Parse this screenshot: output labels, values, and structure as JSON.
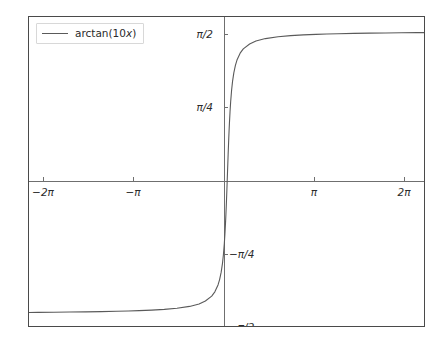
{
  "chart_data": {
    "type": "line",
    "title": "",
    "xlabel": "",
    "ylabel": "",
    "grid": false,
    "legend_position": "upper left",
    "xlim": [
      -6.283185307179586,
      6.283185307179586
    ],
    "ylim": [
      -1.7278759594743862,
      1.7278759594743862
    ],
    "xticks": [
      -6.283185307179586,
      -3.141592653589793,
      3.141592653589793,
      6.283185307179586
    ],
    "xticklabels": [
      "−2π",
      "−π",
      "π",
      "2π"
    ],
    "yticks": [
      -1.5707963267948966,
      -0.7853981633974483,
      0.7853981633974483,
      1.5707963267948966
    ],
    "yticklabels": [
      "−π/2",
      "−π/4",
      "π/4",
      "π/2"
    ],
    "spines": "centered-at-origin",
    "series": [
      {
        "name": "arctan(10x)",
        "legend_label_prefix": "arctan(10",
        "legend_label_variable": "x",
        "legend_label_suffix": ")",
        "color": "#5a5a5a",
        "linewidth": 1.1,
        "formula": "arctan(10*x)",
        "x": [
          -6.2832,
          -6.0,
          -5.5,
          -5.0,
          -4.5,
          -4.0,
          -3.5,
          -3.1416,
          -2.8,
          -2.4,
          -2.0,
          -1.6,
          -1.2,
          -0.9,
          -0.7,
          -0.5,
          -0.4,
          -0.3,
          -0.25,
          -0.2,
          -0.16,
          -0.13,
          -0.1,
          -0.08,
          -0.06,
          -0.05,
          -0.04,
          -0.03,
          -0.02,
          -0.01,
          0.0,
          0.01,
          0.02,
          0.03,
          0.04,
          0.05,
          0.06,
          0.08,
          0.1,
          0.13,
          0.16,
          0.2,
          0.25,
          0.3,
          0.4,
          0.5,
          0.7,
          0.9,
          1.2,
          1.6,
          2.0,
          2.4,
          2.8,
          3.1416,
          3.5,
          4.0,
          4.5,
          5.0,
          5.5,
          6.0,
          6.2832
        ],
        "y": [
          -1.5549,
          -1.5541,
          -1.5526,
          -1.5508,
          -1.5486,
          -1.5458,
          -1.5423,
          -1.539,
          -1.5351,
          -1.5292,
          -1.5208,
          -1.5083,
          -1.488,
          -1.4622,
          -1.4279,
          -1.3734,
          -1.3258,
          -1.249,
          -1.1903,
          -1.1071,
          -1.0122,
          -0.916,
          -0.7854,
          -0.6747,
          -0.5404,
          -0.4636,
          -0.3805,
          -0.2915,
          -0.1974,
          -0.0997,
          0.0,
          0.0997,
          0.1974,
          0.2915,
          0.3805,
          0.4636,
          0.5404,
          0.6747,
          0.7854,
          0.916,
          1.0122,
          1.1071,
          1.1903,
          1.249,
          1.3258,
          1.3734,
          1.4279,
          1.4622,
          1.488,
          1.5083,
          1.5208,
          1.5292,
          1.5351,
          1.539,
          1.5423,
          1.5458,
          1.5486,
          1.5508,
          1.5526,
          1.5541,
          1.5549
        ],
        "annotations": [
          "saturates near +π/2 for x > 0.5",
          "saturates near −π/2 for x < −0.5",
          "steep transition through origin"
        ]
      }
    ]
  },
  "axes": {
    "x_tick_labels": [
      "−2π",
      "−π",
      "π",
      "2π"
    ],
    "y_tick_labels_upper": [
      "π/2",
      "π/4"
    ],
    "y_tick_labels_lower": [
      "−π/4",
      "−π/2"
    ]
  },
  "legend": {
    "label_prefix": "arctan(10",
    "label_variable": "x",
    "label_suffix": ")"
  },
  "colors": {
    "curve": "#5a5a5a",
    "frame": "#4a4a4a",
    "spine": "#6f6f6f",
    "text": "#2b2b2b",
    "background": "#ffffff",
    "legend_border": "#d8d8d8"
  }
}
